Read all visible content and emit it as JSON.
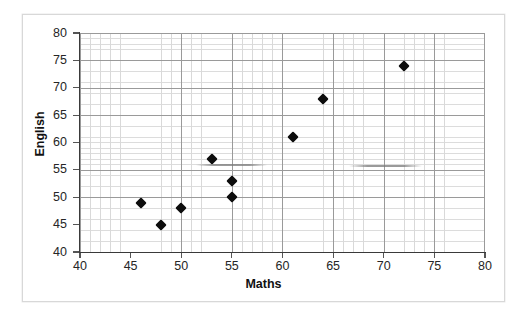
{
  "chart_data": {
    "type": "scatter",
    "title": "",
    "xlabel": "Maths",
    "ylabel": "English",
    "xlim": [
      40,
      80
    ],
    "ylim": [
      40,
      80
    ],
    "x_ticks": [
      40,
      45,
      50,
      55,
      60,
      65,
      70,
      75,
      80
    ],
    "y_ticks": [
      40,
      45,
      50,
      55,
      60,
      65,
      70,
      75,
      80
    ],
    "x_tick_labels": [
      "40",
      "45",
      "50",
      "55",
      "60",
      "65",
      "70",
      "75",
      "80"
    ],
    "y_tick_labels": [
      "40",
      "45",
      "50",
      "55",
      "60",
      "65",
      "70",
      "75",
      "80"
    ],
    "x_major_step": 5,
    "y_major_step": 5,
    "x_minor_step": 1,
    "y_minor_step": 1,
    "grid": true,
    "grid_minor": true,
    "legend": false,
    "legend_position": "none",
    "marker": "diamond",
    "marker_color": "#0d0d0d",
    "series": [
      {
        "name": "Students",
        "points": [
          {
            "x": 46,
            "y": 49
          },
          {
            "x": 48,
            "y": 45
          },
          {
            "x": 50,
            "y": 48
          },
          {
            "x": 53,
            "y": 57
          },
          {
            "x": 55,
            "y": 53
          },
          {
            "x": 55,
            "y": 50
          },
          {
            "x": 61,
            "y": 61
          },
          {
            "x": 64,
            "y": 68
          },
          {
            "x": 72,
            "y": 74
          }
        ]
      }
    ],
    "annotations": [
      {
        "name": "faint-line-left",
        "x_start": 51.5,
        "x_end": 58.5,
        "y": 56.0,
        "color": "#8c8c8c"
      },
      {
        "name": "faint-line-right",
        "x_start": 66.6,
        "x_end": 73.8,
        "y": 55.8,
        "color": "#8c8c8c"
      }
    ]
  },
  "colors": {
    "marker": "#0d0d0d",
    "grid_major": "#9a9a9a",
    "grid_minor": "#d3d3d3",
    "axis": "#3a3a3a",
    "frame": "#d8d8d8",
    "text": "#262626",
    "background": "#ffffff"
  }
}
